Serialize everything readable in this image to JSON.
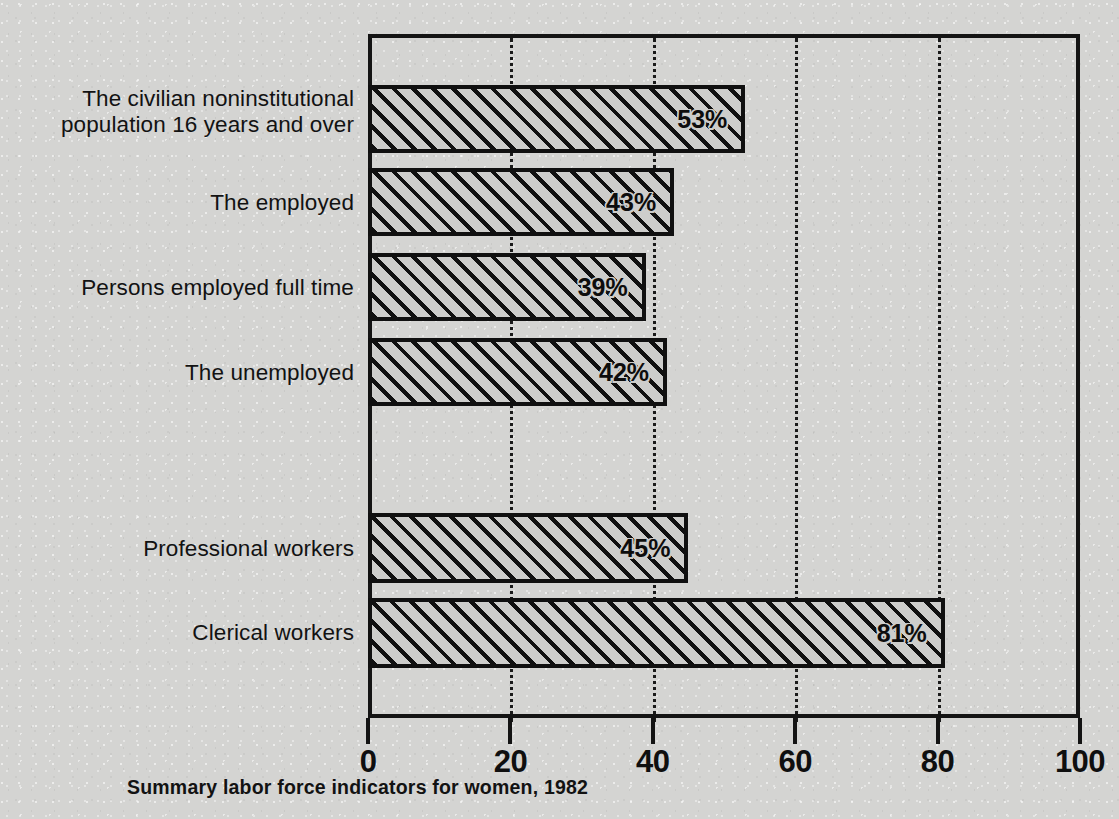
{
  "chart_data": {
    "type": "bar",
    "orientation": "horizontal",
    "title": "",
    "caption": "Summary labor force indicators for women, 1982",
    "xlabel": "",
    "ylabel": "",
    "xlim": [
      0,
      100
    ],
    "grid": "vertical-dotted",
    "legend": "none",
    "value_suffix": "%",
    "categories": [
      "The civilian noninstitutional\npopulation 16 years and over",
      "The employed",
      "Persons employed full time",
      "The unemployed",
      "Professional workers",
      "Clerical workers"
    ],
    "values": [
      53,
      43,
      39,
      42,
      45,
      81
    ],
    "value_labels": [
      "53%",
      "43%",
      "39%",
      "42%",
      "45%",
      "81%"
    ],
    "xticks": [
      0,
      20,
      40,
      60,
      80,
      100
    ],
    "xtick_labels": [
      "0",
      "20",
      "40",
      "60",
      "80",
      "100"
    ],
    "gridline_values": [
      20,
      40,
      60,
      80
    ],
    "groups": [
      {
        "name": "labor-force-status",
        "category_indices": [
          0,
          1,
          2,
          3
        ]
      },
      {
        "name": "occupation",
        "category_indices": [
          4,
          5
        ]
      }
    ],
    "colors": {
      "paper": "#d4d4d2",
      "ink": "#121212",
      "bar_fill": "#cdcdcb",
      "bar_hatch": "#101010"
    }
  },
  "bars": [
    {
      "label": "The civilian noninstitutional\npopulation 16 years and over",
      "value_label": "53%",
      "value": 53,
      "top": 85,
      "height": 68,
      "label_top": 86
    },
    {
      "label": "The employed",
      "value_label": "43%",
      "value": 43,
      "top": 168,
      "height": 68,
      "label_top": 190
    },
    {
      "label": "Persons employed full time",
      "value_label": "39%",
      "value": 39,
      "top": 253,
      "height": 68,
      "label_top": 275
    },
    {
      "label": "The unemployed",
      "value_label": "42%",
      "value": 42,
      "top": 338,
      "height": 68,
      "label_top": 360
    },
    {
      "label": "Professional workers",
      "value_label": "45%",
      "value": 45,
      "top": 513,
      "height": 70,
      "label_top": 536
    },
    {
      "label": "Clerical workers",
      "value_label": "81%",
      "value": 81,
      "top": 598,
      "height": 70,
      "label_top": 620
    }
  ]
}
